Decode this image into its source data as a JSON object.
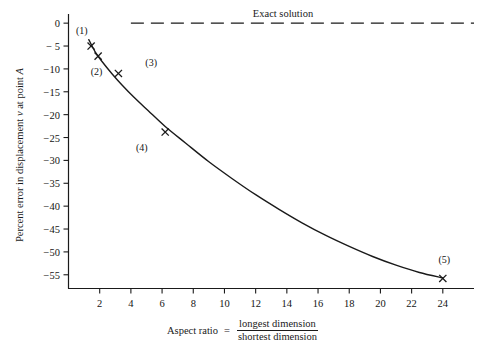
{
  "chart_data": {
    "type": "line",
    "title": "",
    "xlabel": "Aspect ratio",
    "xlabel_equals": "=",
    "xlabel_numerator": "longest dimension",
    "xlabel_denominator": "shortest dimension",
    "ylabel_prefix": "Percent error in displacement ",
    "ylabel_var": "v",
    "ylabel_suffix": " at point ",
    "ylabel_point": "A",
    "xlim": [
      0,
      26
    ],
    "ylim": [
      -58,
      2
    ],
    "grid": false,
    "legend_position": "none",
    "xticks": [
      2,
      4,
      6,
      8,
      10,
      12,
      14,
      16,
      18,
      20,
      22,
      24
    ],
    "xtick_labels": [
      "2",
      "4",
      "6",
      "8",
      "10",
      "12",
      "14",
      "16",
      "18",
      "20",
      "22",
      "24"
    ],
    "yticks": [
      0,
      -5,
      -10,
      -15,
      -20,
      -25,
      -30,
      -35,
      -40,
      -45,
      -50,
      -55
    ],
    "ytick_labels": [
      "0",
      "− 5",
      "−10",
      "−15",
      "−20",
      "−25",
      "−30",
      "−35",
      "−40",
      "−45",
      "−50",
      "−55"
    ],
    "series": [
      {
        "name": "Finite element solution",
        "style": "solid-curve",
        "color": "#1a1a1a",
        "x": [
          1.3,
          1.7,
          2.2,
          2.8,
          3.4,
          4.2,
          5.1,
          6.2,
          7.5,
          9.0,
          10.5,
          12.0,
          13.5,
          15.0,
          16.5,
          18.0,
          19.5,
          21.0,
          22.5,
          24.0
        ],
        "y": [
          -3.6,
          -6.2,
          -8.6,
          -11.1,
          -13.4,
          -16.2,
          -19.1,
          -22.6,
          -26.2,
          -30.3,
          -34.0,
          -37.5,
          -40.7,
          -43.7,
          -46.4,
          -48.8,
          -51.0,
          -52.9,
          -54.5,
          -55.7
        ]
      },
      {
        "name": "Exact solution",
        "style": "dashed-horizontal",
        "color": "#1a1a1a",
        "x": [
          4.0,
          26.0
        ],
        "y": [
          0,
          0
        ]
      }
    ],
    "markers": [
      {
        "label": "(1)",
        "x": 1.45,
        "y": -5.0,
        "label_dx": -0.6,
        "label_dy": 3.6
      },
      {
        "label": "(2)",
        "x": 1.9,
        "y": -7.2,
        "label_dx": -0.1,
        "label_dy": -3.2
      },
      {
        "label": "(3)",
        "x": 3.2,
        "y": -11.0,
        "label_dx": 2.1,
        "label_dy": 2.6
      },
      {
        "label": "(4)",
        "x": 6.2,
        "y": -23.8,
        "label_dx": -1.5,
        "label_dy": -3.2
      },
      {
        "label": "(5)",
        "x": 24.0,
        "y": -55.8,
        "label_dx": 0.1,
        "label_dy": 4.2
      }
    ],
    "annotations": [
      {
        "name": "exact-solution-label",
        "text": "Exact solution"
      }
    ]
  }
}
